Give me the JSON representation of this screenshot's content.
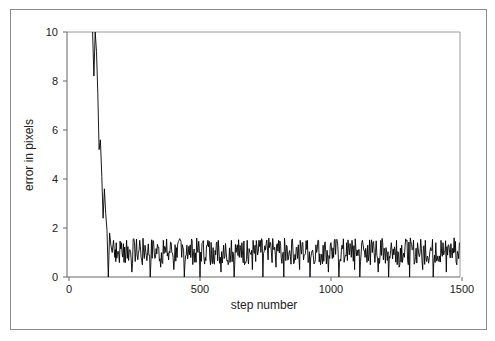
{
  "chart_data": {
    "type": "line",
    "title": "",
    "xlabel": "step number",
    "ylabel": "error in pixels",
    "xlim": [
      0,
      1500
    ],
    "ylim": [
      0,
      10
    ],
    "xticks": [
      0,
      500,
      1000,
      1500
    ],
    "yticks": [
      0,
      2,
      4,
      6,
      8,
      10
    ],
    "grid": false,
    "legend": null,
    "series": [
      {
        "name": "error",
        "color": "#000000",
        "description": "Error starts above 10 around step 90, decays steeply to ~1.3 by step ~175, then fluctuates noisily between ~0.3 and ~1.6 with frequent drops to 0 through step 1500.",
        "x": [
          90,
          95,
          100,
          105,
          110,
          115,
          120,
          125,
          130,
          135,
          140,
          145,
          150,
          155,
          160,
          165,
          170,
          175,
          180,
          190,
          200,
          210,
          220,
          230,
          240,
          250,
          260,
          270,
          280,
          290,
          300,
          310,
          320,
          330,
          340,
          350,
          360,
          370,
          380,
          390,
          400,
          410,
          420,
          430,
          440,
          450,
          460,
          470,
          480,
          490,
          500,
          510,
          520,
          530,
          540,
          550,
          560,
          570,
          580,
          590,
          600,
          610,
          620,
          630,
          640,
          650,
          660,
          670,
          680,
          690,
          700,
          710,
          720,
          730,
          740,
          750,
          760,
          770,
          780,
          790,
          800,
          810,
          820,
          830,
          840,
          850,
          860,
          870,
          880,
          890,
          900,
          910,
          920,
          930,
          940,
          950,
          960,
          970,
          980,
          990,
          1000,
          1010,
          1020,
          1030,
          1040,
          1050,
          1060,
          1070,
          1080,
          1090,
          1100,
          1110,
          1120,
          1130,
          1140,
          1150,
          1160,
          1170,
          1180,
          1190,
          1200,
          1210,
          1220,
          1230,
          1240,
          1250,
          1260,
          1270,
          1280,
          1290,
          1300,
          1310,
          1320,
          1330,
          1340,
          1350,
          1360,
          1370,
          1380,
          1390,
          1400,
          1410,
          1420,
          1430,
          1440,
          1450,
          1460,
          1470,
          1480,
          1490
        ],
        "y": [
          10,
          8.2,
          10,
          9.2,
          7.5,
          5.2,
          5.6,
          4.1,
          2.4,
          3.6,
          2.6,
          1.9,
          0,
          1.8,
          1.3,
          1.0,
          1.5,
          0.8,
          1.4,
          0.9,
          1.4,
          0.6,
          1.5,
          1.1,
          0.2,
          1.4,
          0.9,
          1.5,
          0.5,
          1.3,
          1.0,
          0,
          1.5,
          0.8,
          1.2,
          0.4,
          1.5,
          1.0,
          0.7,
          1.4,
          0.3,
          1.2,
          1.5,
          0.8,
          0,
          1.3,
          0.9,
          1.5,
          0.6,
          1.1,
          0,
          1.4,
          0.8,
          1.5,
          0.5,
          1.2,
          0.9,
          1.5,
          0.2,
          1.3,
          1.0,
          0.6,
          1.5,
          0,
          1.2,
          0.8,
          1.4,
          0.5,
          1.5,
          1.0,
          0.3,
          1.3,
          0.9,
          1.5,
          0,
          1.1,
          0.7,
          1.4,
          1.2,
          0.4,
          1.5,
          0.8,
          0,
          1.3,
          1.0,
          1.5,
          0.6,
          1.2,
          0.3,
          1.4,
          0.9,
          1.5,
          0,
          1.1,
          0.7,
          1.5,
          0.5,
          1.3,
          1.0,
          0.2,
          1.4,
          0.8,
          1.5,
          0,
          1.2,
          0.6,
          1.4,
          0.9,
          1.5,
          0.3,
          1.1,
          0,
          1.5,
          0.8,
          1.3,
          0.5,
          1.4,
          1.0,
          0.2,
          1.5,
          0.7,
          1.2,
          0,
          1.4,
          0.9,
          1.5,
          0.4,
          1.3,
          0.8,
          1.5,
          0,
          1.1,
          0.6,
          1.4,
          1.0,
          0.3,
          1.5,
          0.8,
          1.2,
          0,
          1.4,
          0.7,
          1.5,
          0.9,
          0.2,
          1.3,
          1.0,
          1.6,
          0.5,
          1.4
        ]
      }
    ]
  }
}
